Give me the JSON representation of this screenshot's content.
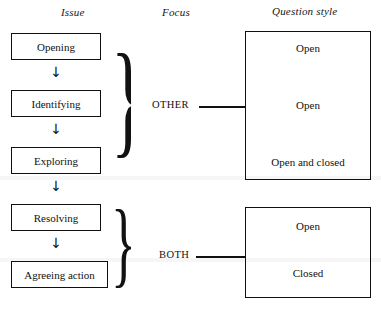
{
  "headers": {
    "issue": "Issue",
    "focus": "Focus",
    "question_style": "Question style"
  },
  "stages": [
    {
      "label": "Opening"
    },
    {
      "label": "Identifying"
    },
    {
      "label": "Exploring"
    },
    {
      "label": "Resolving"
    },
    {
      "label": "Agreeing action"
    }
  ],
  "arrows": {
    "glyph": "↓"
  },
  "braces": {
    "glyph": "}",
    "upper_groups": [
      "Opening",
      "Identifying",
      "Exploring"
    ],
    "lower_groups": [
      "Resolving",
      "Agreeing action"
    ]
  },
  "focus": [
    {
      "label": "OTHER"
    },
    {
      "label": "BOTH"
    }
  ],
  "question_styles": {
    "top_box": [
      "Open",
      "Open",
      "Open and closed"
    ],
    "bottom_box": [
      "Open",
      "Closed"
    ]
  },
  "colors": {
    "ink": "#111111",
    "background": "#ffffff",
    "border": "#101010"
  }
}
